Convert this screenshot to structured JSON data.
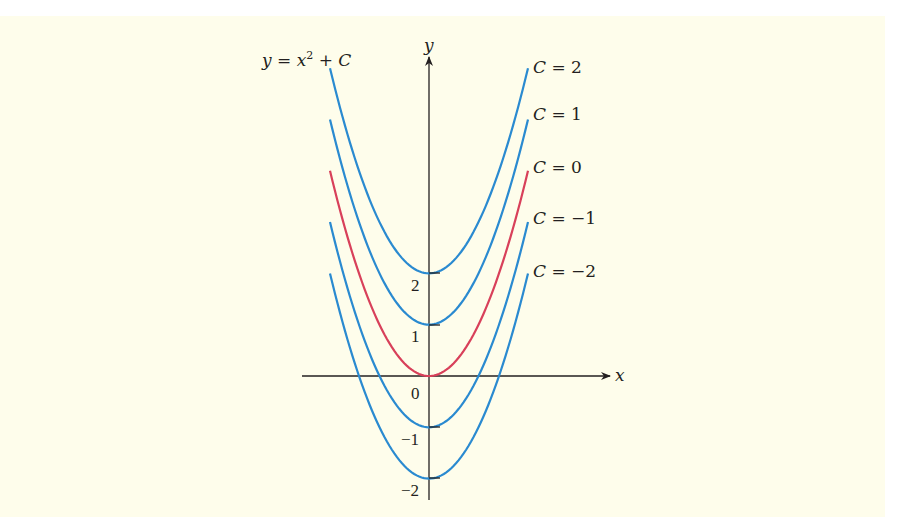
{
  "chart_data": {
    "type": "line",
    "xlabel": "x",
    "ylabel": "y",
    "x_range": [
      -2,
      2
    ],
    "ylim": [
      -2,
      6
    ],
    "grid": false,
    "legend_position": "inline-right",
    "y_tick_labels": [
      "2",
      "1",
      "0",
      "−1",
      "−2"
    ],
    "series": [
      {
        "name": "C = 2",
        "C": 2,
        "color": "#2a8ad0",
        "vertex": [
          0,
          2
        ],
        "x": [
          -2,
          -1,
          0,
          1,
          2
        ],
        "values": [
          6,
          3,
          2,
          3,
          6
        ]
      },
      {
        "name": "C = 1",
        "C": 1,
        "color": "#2a8ad0",
        "vertex": [
          0,
          1
        ],
        "x": [
          -2,
          -1,
          0,
          1,
          2
        ],
        "values": [
          5,
          2,
          1,
          2,
          5
        ]
      },
      {
        "name": "C = 0",
        "C": 0,
        "color": "#d8405a",
        "vertex": [
          0,
          0
        ],
        "x": [
          -2,
          -1,
          0,
          1,
          2
        ],
        "values": [
          4,
          1,
          0,
          1,
          4
        ]
      },
      {
        "name": "C = −1",
        "C": -1,
        "color": "#2a8ad0",
        "vertex": [
          0,
          -1
        ],
        "x": [
          -2,
          -1,
          0,
          1,
          2
        ],
        "values": [
          3,
          0,
          -1,
          0,
          3
        ]
      },
      {
        "name": "C = −2",
        "C": -2,
        "color": "#2a8ad0",
        "vertex": [
          0,
          -2
        ],
        "x": [
          -2,
          -1,
          0,
          1,
          2
        ],
        "values": [
          2,
          -1,
          -2,
          -1,
          2
        ]
      }
    ]
  },
  "labels": {
    "title_y": "y",
    "title_eq": " = ",
    "title_x": "x",
    "title_exp": "2",
    "title_plus": " + ",
    "title_c": "C",
    "axis_x": "x",
    "axis_y": "y",
    "tick_2": "2",
    "tick_1": "1",
    "tick_0": "0",
    "tick_m1": "−1",
    "tick_m2": "−2",
    "legend_c": "C",
    "legend_eq": " = ",
    "legend_v2": "2",
    "legend_v1": "1",
    "legend_v0": "0",
    "legend_vm1": "−1",
    "legend_vm2": "−2"
  },
  "colors": {
    "background": "#fefdeb",
    "blue": "#2a8ad0",
    "red": "#d8405a",
    "axis": "#231f20"
  }
}
